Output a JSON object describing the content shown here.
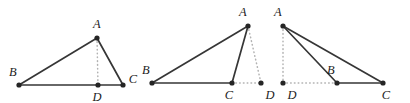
{
  "figure": {
    "background_color": "#ffffff",
    "solid_line_color": "#363636",
    "dotted_line_color": "#b2b2b2",
    "vertex_color": "#252525",
    "label_color": "#1c1c1c",
    "width": 410,
    "height": 103,
    "panels": [
      {
        "id": "panel-1",
        "name": "acute-triangle-foot-inside",
        "points": {
          "A": {
            "label": "A",
            "x": 97,
            "y": 38,
            "label_x": 97,
            "label_y": 24
          },
          "B": {
            "label": "B",
            "x": 19,
            "y": 85,
            "label_x": 13,
            "label_y": 72
          },
          "C": {
            "label": "C",
            "x": 123,
            "y": 85,
            "label_x": 133,
            "label_y": 79
          },
          "D": {
            "label": "D",
            "x": 98,
            "y": 85,
            "label_x": 97,
            "label_y": 97
          }
        },
        "solid_edges": [
          {
            "name": "edge-AB",
            "from": "B",
            "to": "A"
          },
          {
            "name": "edge-AC",
            "from": "A",
            "to": "C"
          },
          {
            "name": "edge-BC",
            "from": "B",
            "to": "C"
          }
        ],
        "dotted_edges": [
          {
            "name": "altitude-AD",
            "from": "A",
            "to": "D"
          }
        ]
      },
      {
        "id": "panel-2",
        "name": "obtuse-triangle-foot-right-of-C",
        "points": {
          "A": {
            "label": "A",
            "x": 248,
            "y": 26,
            "label_x": 243,
            "label_y": 12
          },
          "B": {
            "label": "B",
            "x": 152,
            "y": 83,
            "label_x": 146,
            "label_y": 70
          },
          "C": {
            "label": "C",
            "x": 232,
            "y": 83,
            "label_x": 229,
            "label_y": 95
          },
          "D": {
            "label": "D",
            "x": 261,
            "y": 83,
            "label_x": 270,
            "label_y": 95
          }
        },
        "solid_edges": [
          {
            "name": "edge-AB",
            "from": "B",
            "to": "A"
          },
          {
            "name": "edge-AC",
            "from": "A",
            "to": "C"
          },
          {
            "name": "edge-BC",
            "from": "B",
            "to": "C"
          }
        ],
        "dotted_edges": [
          {
            "name": "altitude-AD",
            "from": "A",
            "to": "D"
          },
          {
            "name": "extension-CD",
            "from": "C",
            "to": "D"
          }
        ]
      },
      {
        "id": "panel-3",
        "name": "obtuse-triangle-foot-left-of-B",
        "points": {
          "A": {
            "label": "A",
            "x": 283,
            "y": 26,
            "label_x": 278,
            "label_y": 12
          },
          "B": {
            "label": "B",
            "x": 337,
            "y": 83,
            "label_x": 331,
            "label_y": 70
          },
          "C": {
            "label": "C",
            "x": 383,
            "y": 83,
            "label_x": 386,
            "label_y": 95
          },
          "D": {
            "label": "D",
            "x": 283,
            "y": 83,
            "label_x": 292,
            "label_y": 95
          }
        },
        "solid_edges": [
          {
            "name": "edge-AB",
            "from": "A",
            "to": "B"
          },
          {
            "name": "edge-AC",
            "from": "A",
            "to": "C"
          },
          {
            "name": "edge-BC",
            "from": "B",
            "to": "C"
          }
        ],
        "dotted_edges": [
          {
            "name": "altitude-AD",
            "from": "A",
            "to": "D"
          },
          {
            "name": "extension-DB",
            "from": "D",
            "to": "B"
          }
        ]
      }
    ]
  }
}
